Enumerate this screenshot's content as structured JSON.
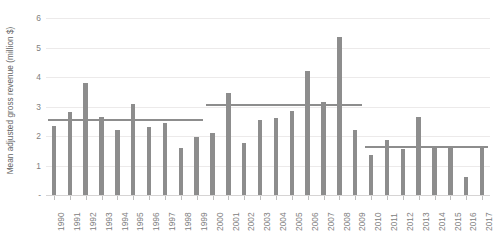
{
  "chart_data": {
    "type": "bar",
    "title": "",
    "xlabel": "",
    "ylabel": "Mean adjusted gross revenue (million $)",
    "ylim": [
      0,
      6
    ],
    "yticks": [
      0,
      1,
      2,
      3,
      4,
      5,
      6
    ],
    "ytick_labels": [
      "-",
      "1",
      "2",
      "3",
      "4",
      "5",
      "6"
    ],
    "grid": true,
    "legend": "none",
    "bar_color": "#8d8d8d",
    "gridline_color": "#eceaea",
    "categories": [
      "1990",
      "1991",
      "1992",
      "1993",
      "1994",
      "1995",
      "1996",
      "1997",
      "1998",
      "1999",
      "2000",
      "2001",
      "2002",
      "2003",
      "2004",
      "2005",
      "2006",
      "2007",
      "2008",
      "2009",
      "2010",
      "2011",
      "2012",
      "2013",
      "2014",
      "2015",
      "2016",
      "2017"
    ],
    "values": [
      2.35,
      2.8,
      3.8,
      2.65,
      2.2,
      3.1,
      2.3,
      2.45,
      1.6,
      1.95,
      2.1,
      3.45,
      1.75,
      2.55,
      2.6,
      2.85,
      4.2,
      3.15,
      5.35,
      2.2,
      1.35,
      1.85,
      1.55,
      2.65,
      1.6,
      1.6,
      0.6,
      1.65
    ],
    "annotations": [
      {
        "name": "decade-mean-1990s",
        "label": "",
        "value": 2.55,
        "start_category": "1990",
        "end_category": "1999"
      },
      {
        "name": "decade-mean-2000s",
        "label": "",
        "value": 3.05,
        "start_category": "2000",
        "end_category": "2009"
      },
      {
        "name": "decade-mean-2010s",
        "label": "",
        "value": 1.63,
        "start_category": "2010",
        "end_category": "2017"
      }
    ]
  }
}
